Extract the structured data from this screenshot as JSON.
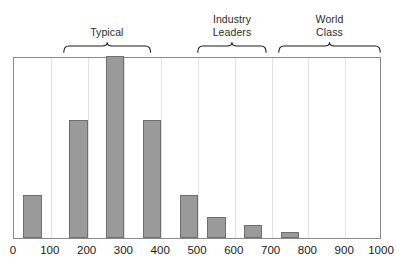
{
  "chart_data": {
    "type": "bar",
    "title": "",
    "subtitle": "",
    "xlabel": "",
    "ylabel": "",
    "xlim": [
      0,
      1000
    ],
    "ylim": [
      0,
      17
    ],
    "grid": true,
    "grid_axis": "x",
    "legend": "none",
    "orientation": "vertical",
    "bin_width": 50,
    "categories": [
      "25-75",
      "150-200",
      "250-300",
      "350-400",
      "450-500",
      "525-575",
      "625-675",
      "725-775"
    ],
    "x": [
      50,
      175,
      275,
      375,
      475,
      550,
      650,
      750
    ],
    "bin_starts": [
      25,
      150,
      250,
      350,
      450,
      525,
      625,
      725
    ],
    "values": [
      4,
      11,
      17,
      11,
      4,
      2,
      1.2,
      0.6
    ],
    "tick_labels": [
      "0",
      "100",
      "200",
      "300",
      "400",
      "500",
      "600",
      "700",
      "800",
      "900",
      "1000"
    ],
    "tick_values": [
      0,
      100,
      200,
      300,
      400,
      500,
      600,
      700,
      800,
      900,
      1000
    ],
    "bar_color": "#9a9a9a",
    "bar_edge_color": "#6e6e6e",
    "grid_color": "#e2e2e2",
    "frame_color": "#8a8a8a",
    "annotations": [
      {
        "label": "Typical",
        "range": [
          135,
          375
        ]
      },
      {
        "label": "Industry\nLeaders",
        "range": [
          500,
          690
        ]
      },
      {
        "label": "World\nClass",
        "range": [
          720,
          1000
        ]
      }
    ]
  }
}
